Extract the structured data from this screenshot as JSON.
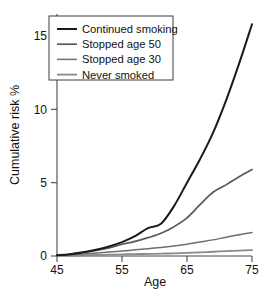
{
  "chart_data": {
    "type": "line",
    "title": "",
    "xlabel": "Age",
    "ylabel": "Cumulative risk %",
    "xlim": [
      45,
      75
    ],
    "ylim": [
      0,
      16.5
    ],
    "xticks": [
      45,
      55,
      65,
      75
    ],
    "xtick_labels": [
      "45",
      "55",
      "65",
      "75"
    ],
    "yticks": [
      0,
      5,
      10,
      15
    ],
    "ytick_labels": [
      "0",
      "5",
      "10",
      "15"
    ],
    "grid": false,
    "legend_position": "top-left",
    "x": [
      45,
      47,
      49,
      51,
      53,
      55,
      57,
      59,
      61,
      63,
      65,
      67,
      69,
      71,
      73,
      75
    ],
    "series": [
      {
        "name": "Continued smoking",
        "color": "#1a1a1a",
        "width": 2.0,
        "values": [
          0.05,
          0.12,
          0.25,
          0.42,
          0.65,
          0.95,
          1.35,
          1.9,
          2.2,
          3.4,
          5.0,
          6.6,
          8.4,
          10.6,
          13.1,
          15.8
        ]
      },
      {
        "name": "Stopped age 50",
        "color": "#5a5a5a",
        "width": 1.7,
        "values": [
          0.05,
          0.12,
          0.24,
          0.38,
          0.55,
          0.8,
          1.0,
          1.25,
          1.55,
          2.0,
          2.6,
          3.5,
          4.35,
          4.85,
          5.4,
          5.9
        ]
      },
      {
        "name": "Stopped age 30",
        "color": "#6e6e6e",
        "width": 1.5,
        "values": [
          0.04,
          0.08,
          0.14,
          0.2,
          0.27,
          0.34,
          0.42,
          0.5,
          0.58,
          0.68,
          0.8,
          0.95,
          1.1,
          1.28,
          1.45,
          1.6
        ]
      },
      {
        "name": "Never smoked",
        "color": "#8a8a8a",
        "width": 1.8,
        "values": [
          0.02,
          0.03,
          0.05,
          0.07,
          0.09,
          0.11,
          0.13,
          0.14,
          0.16,
          0.18,
          0.21,
          0.25,
          0.29,
          0.33,
          0.37,
          0.4
        ]
      }
    ]
  },
  "legend": {
    "entries": [
      {
        "label": "Continued smoking"
      },
      {
        "label": "Stopped age 50"
      },
      {
        "label": "Stopped age 30"
      },
      {
        "label": "Never smoked"
      }
    ]
  },
  "axes": {
    "x_title": "Age",
    "y_title": "Cumulative risk %"
  }
}
